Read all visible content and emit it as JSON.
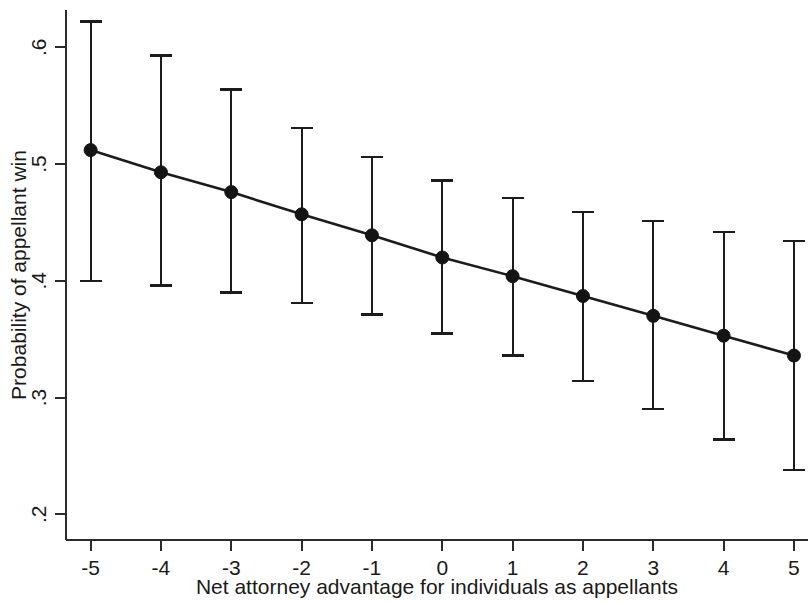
{
  "chart_data": {
    "type": "line",
    "title": "",
    "subtitle": "",
    "xlabel": "Net attorney advantage for individuals as appellants",
    "ylabel": "Probability of appellant win",
    "x": [
      -5,
      -4,
      -3,
      -2,
      -1,
      0,
      1,
      2,
      3,
      4,
      5
    ],
    "values": [
      0.512,
      0.493,
      0.476,
      0.457,
      0.439,
      0.42,
      0.404,
      0.387,
      0.37,
      0.353,
      0.336
    ],
    "ci_lower": [
      0.4,
      0.396,
      0.39,
      0.381,
      0.371,
      0.355,
      0.336,
      0.314,
      0.29,
      0.264,
      0.238
    ],
    "ci_upper": [
      0.622,
      0.593,
      0.564,
      0.531,
      0.506,
      0.486,
      0.471,
      0.459,
      0.451,
      0.442,
      0.434
    ],
    "series": [
      {
        "name": "Predicted probability",
        "values": [
          0.512,
          0.493,
          0.476,
          0.457,
          0.439,
          0.42,
          0.404,
          0.387,
          0.37,
          0.353,
          0.336
        ]
      }
    ],
    "xtick_labels": [
      "-5",
      "-4",
      "-3",
      "-2",
      "-1",
      "0",
      "1",
      "2",
      "3",
      "4",
      "5"
    ],
    "ytick_values": [
      0.2,
      0.3,
      0.4,
      0.5,
      0.6
    ],
    "ytick_labels": [
      ".2",
      ".3",
      ".4",
      ".5",
      ".6"
    ],
    "xlim": [
      -5.35,
      5.2
    ],
    "ylim": [
      0.178,
      0.632
    ],
    "grid": false,
    "legend": "none",
    "marker": "filled-circle",
    "error_bars": "vertical-with-caps",
    "line_color": "#1c1c1c",
    "marker_color": "#141414",
    "background": "#ffffff"
  },
  "axes": {
    "y_title": "Probability of appellant win",
    "x_title": "Net attorney advantage for individuals as appellants"
  }
}
